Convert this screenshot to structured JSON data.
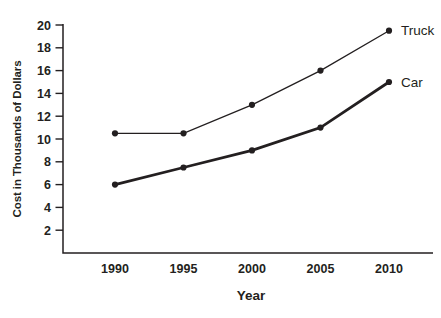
{
  "chart_data": {
    "type": "line",
    "title": "",
    "xlabel": "Year",
    "ylabel": "Cost in Thousands of Dollars",
    "categories": [
      "1990",
      "1995",
      "2000",
      "2005",
      "2010"
    ],
    "series": [
      {
        "name": "Truck",
        "values": [
          10.5,
          10.5,
          13,
          16,
          19.5
        ],
        "line_style": "thin"
      },
      {
        "name": "Car",
        "values": [
          6,
          7.5,
          9,
          11,
          15
        ],
        "line_style": "thick"
      }
    ],
    "ylim": [
      0,
      20
    ],
    "yticks": [
      2,
      4,
      6,
      8,
      10,
      12,
      14,
      16,
      18,
      20
    ],
    "grid": false,
    "marker": "filled-circle",
    "legend_position": "line-end-labels",
    "colors": {
      "ink": "#231f20",
      "background": "#ffffff"
    }
  }
}
